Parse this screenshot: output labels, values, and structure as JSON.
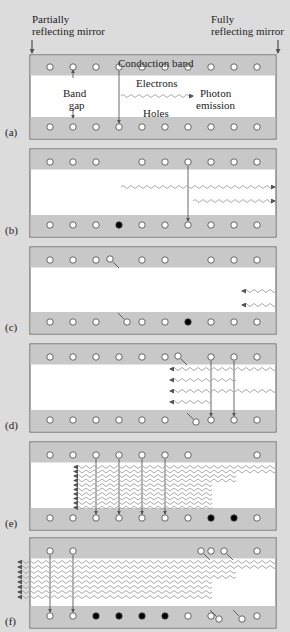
{
  "header": {
    "left_label_line1": "Partially",
    "left_label_line2": "reflecting mirror",
    "right_label_line1": "Fully",
    "right_label_line2": "reflecting mirror"
  },
  "panel_a": {
    "conduction": "Conduction band",
    "band": "Band",
    "gap": "gap",
    "electrons": "Electrons",
    "photon1": "Photon",
    "photon2": "emission",
    "holes": "Holes"
  },
  "panels": [
    {
      "label": "(a)",
      "top": 55,
      "height": 84
    },
    {
      "label": "(b)",
      "top": 149,
      "height": 88
    },
    {
      "label": "(c)",
      "top": 247,
      "height": 87
    },
    {
      "label": "(d)",
      "top": 344,
      "height": 88
    },
    {
      "label": "(e)",
      "top": 442,
      "height": 88
    },
    {
      "label": "(f)",
      "top": 538,
      "height": 90
    }
  ],
  "colors": {
    "background": "#dcdcdc",
    "band": "#c8c8c8",
    "gap": "#ffffff",
    "frame": "#555555"
  }
}
